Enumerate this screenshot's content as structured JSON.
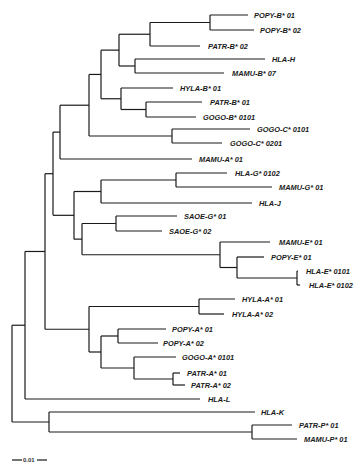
{
  "figure": {
    "type": "phylogenetic-tree",
    "scale_bar_label": "0.01",
    "branch_color": "#1a1a1a"
  },
  "leaves": [
    {
      "id": "popy_b01",
      "label": "POPY-B* 01"
    },
    {
      "id": "popy_b02",
      "label": "POPY-B* 02"
    },
    {
      "id": "patr_b02",
      "label": "PATR-B* 02"
    },
    {
      "id": "hla_h",
      "label": "HLA-H"
    },
    {
      "id": "mamu_b07",
      "label": "MAMU-B* 07"
    },
    {
      "id": "hyla_b01",
      "label": "HYLA-B* 01"
    },
    {
      "id": "patr_b01",
      "label": "PATR-B* 01"
    },
    {
      "id": "gogo_b0101",
      "label": "GOGO-B* 0101"
    },
    {
      "id": "gogo_c0101",
      "label": "GOGO-C* 0101"
    },
    {
      "id": "gogo_c0201",
      "label": "GOGO-C* 0201"
    },
    {
      "id": "mamu_a01",
      "label": "MAMU-A* 01"
    },
    {
      "id": "hla_g0102",
      "label": "HLA-G* 0102"
    },
    {
      "id": "mamu_g01",
      "label": "MAMU-G* 01"
    },
    {
      "id": "hla_j",
      "label": "HLA-J"
    },
    {
      "id": "saoe_g01",
      "label": "SAOE-G* 01"
    },
    {
      "id": "saoe_g02",
      "label": "SAOE-G* 02"
    },
    {
      "id": "mamu_e01",
      "label": "MAMU-E* 01"
    },
    {
      "id": "popy_e01",
      "label": "POPY-E* 01"
    },
    {
      "id": "hla_e0101",
      "label": "HLA-E* 0101"
    },
    {
      "id": "hla_e0102",
      "label": "HLA-E* 0102"
    },
    {
      "id": "hyla_a01",
      "label": "HYLA-A* 01"
    },
    {
      "id": "hyla_a02",
      "label": "HYLA-A* 02"
    },
    {
      "id": "popy_a01",
      "label": "POPY-A* 01"
    },
    {
      "id": "popy_a02",
      "label": "POPY-A* 02"
    },
    {
      "id": "gogo_a0101",
      "label": "GOGO-A* 0101"
    },
    {
      "id": "patr_a01",
      "label": "PATR-A* 01"
    },
    {
      "id": "patr_a02",
      "label": "PATR-A* 02"
    },
    {
      "id": "hla_l",
      "label": "HLA-L"
    },
    {
      "id": "hla_k",
      "label": "HLA-K"
    },
    {
      "id": "patr_p01",
      "label": "PATR-P* 01"
    },
    {
      "id": "mamu_p01",
      "label": "MAMU-P* 01"
    }
  ],
  "topology": "((((((((POPY-B*01,POPY-B*02),PATR-B*02),(HLA-H,MAMU-B*07)),(HYLA-B*01,(PATR-B*01,GOGO-B*0101))),(GOGO-C*0101,GOGO-C*0201)),MAMU-A*01),(((HLA-G*0102,MAMU-G*01),HLA-J),((SAOE-G*01,SAOE-G*02),(MAMU-E*01,(POPY-E*01,(HLA-E*0101,HLA-E*0102)))))),((HYLA-A*01,HYLA-A*02),((POPY-A*01,POPY-A*02),(GOGO-A*0101,(PATR-A*01,PATR-A*02))))),HLA-L),(HLA-K,(PATR-P*01,MAMU-P*01)));"
}
